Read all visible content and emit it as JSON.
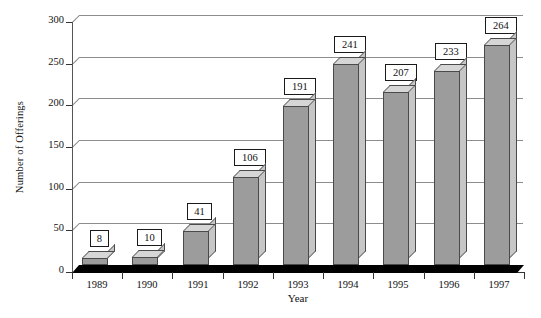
{
  "chart_data": {
    "type": "bar",
    "title": "",
    "xlabel": "Year",
    "ylabel": "Number of Offerings",
    "categories": [
      "1989",
      "1990",
      "1991",
      "1992",
      "1993",
      "1994",
      "1995",
      "1996",
      "1997"
    ],
    "values": [
      8,
      10,
      41,
      106,
      191,
      241,
      207,
      233,
      264
    ],
    "value_labels": [
      "8",
      "10",
      "41",
      "106",
      "191",
      "241",
      "207",
      "233",
      "264"
    ],
    "ylim": [
      0,
      300
    ],
    "yticks": [
      0,
      50,
      100,
      150,
      200,
      250,
      300
    ],
    "ytick_labels": [
      "0",
      "50",
      "100",
      "150",
      "200",
      "250",
      "300"
    ],
    "grid": true,
    "legend": "none",
    "style": "3d-column",
    "colors": {
      "bar_front": "#9c9c9c",
      "bar_side": "#c6c6c6",
      "bar_top": "#d6d6d6",
      "bar_edge": "#4a4a4a",
      "gridline": "#8d8d8d",
      "axis": "#333333",
      "floor": "#000000",
      "label_box_bg": "#ffffff",
      "text": "#111111",
      "background": "#ffffff"
    }
  }
}
